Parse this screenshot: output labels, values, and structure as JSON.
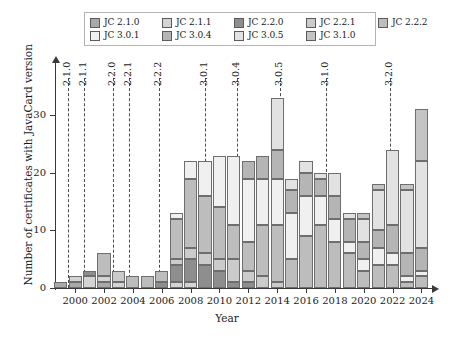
{
  "legend": {
    "rows": [
      [
        {
          "label": "JC 2.1.0",
          "color": "#a9a9a9"
        },
        {
          "label": "JC 2.1.1",
          "color": "#d4d4d4"
        },
        {
          "label": "JC 2.2.0",
          "color": "#8e8e8e"
        },
        {
          "label": "JC 2.2.1",
          "color": "#cbcbcb"
        },
        {
          "label": "JC 2.2.2",
          "color": "#bdbdbd"
        }
      ],
      [
        {
          "label": "JC 3.0.1",
          "color": "#f0f0f0"
        },
        {
          "label": "JC 3.0.4",
          "color": "#b5b5b5"
        },
        {
          "label": "JC 3.0.5",
          "color": "#e2e2e2"
        },
        {
          "label": "JC 3.1.0",
          "color": "#c4c4c4"
        }
      ]
    ]
  },
  "axes": {
    "ylabel": "Number of certificates with JavaCard version",
    "xlabel": "Year",
    "yticks": [
      0,
      10,
      20,
      30
    ],
    "xticks": [
      2000,
      2002,
      2004,
      2006,
      2008,
      2010,
      2012,
      2014,
      2016,
      2018,
      2020,
      2022,
      2024
    ]
  },
  "version_markers": [
    {
      "label": "2.1.0",
      "year": 1999.5
    },
    {
      "label": "2.1.1",
      "year": 2000.6
    },
    {
      "label": "2.2.0",
      "year": 2002.6
    },
    {
      "label": "2.2.1",
      "year": 2003.7
    },
    {
      "label": "2.2.2",
      "year": 2005.8
    },
    {
      "label": "3.0.1",
      "year": 2009.0
    },
    {
      "label": "3.0.4",
      "year": 2011.2
    },
    {
      "label": "3.0.5",
      "year": 2014.2
    },
    {
      "label": "3.1.0",
      "year": 2017.4
    },
    {
      "label": "3.2.0",
      "year": 2021.8
    }
  ],
  "chart_data": {
    "type": "bar",
    "stacked": true,
    "title": "",
    "xlabel": "Year",
    "ylabel": "Number of certificates with JavaCard version",
    "ylim": [
      0,
      34
    ],
    "xlim": [
      1998.6,
      2024.8
    ],
    "grid": false,
    "legend_position": "top",
    "categories": [
      1999,
      2000,
      2001,
      2002,
      2003,
      2004,
      2005,
      2006,
      2007,
      2008,
      2009,
      2010,
      2011,
      2012,
      2013,
      2014,
      2015,
      2016,
      2017,
      2018,
      2019,
      2020,
      2021,
      2022,
      2023,
      2024
    ],
    "series": [
      {
        "name": "JC 2.1.0",
        "color": "#a9a9a9",
        "values": [
          1,
          1,
          0,
          1,
          0,
          0,
          0,
          0,
          0,
          0,
          0,
          0,
          0,
          0,
          0,
          0,
          0,
          0,
          0,
          0,
          0,
          0,
          0,
          0,
          0,
          0
        ]
      },
      {
        "name": "JC 2.1.1",
        "color": "#d4d4d4",
        "values": [
          0,
          1,
          2,
          1,
          1,
          0,
          0,
          0,
          1,
          1,
          0,
          0,
          0,
          0,
          0,
          0,
          0,
          0,
          0,
          0,
          0,
          0,
          0,
          0,
          0,
          0
        ]
      },
      {
        "name": "JC 2.2.0",
        "color": "#8e8e8e",
        "values": [
          0,
          0,
          1,
          0,
          0,
          0,
          0,
          1,
          3,
          4,
          4,
          3,
          1,
          1,
          0,
          0,
          0,
          0,
          0,
          0,
          0,
          0,
          0,
          0,
          0,
          0
        ]
      },
      {
        "name": "JC 2.2.1",
        "color": "#cbcbcb",
        "values": [
          0,
          0,
          0,
          0,
          2,
          0,
          0,
          0,
          1,
          2,
          2,
          2,
          4,
          2,
          2,
          1,
          0,
          0,
          0,
          0,
          0,
          0,
          0,
          0,
          0,
          0
        ]
      },
      {
        "name": "JC 2.2.2",
        "color": "#bdbdbd",
        "values": [
          0,
          0,
          0,
          4,
          0,
          2,
          2,
          2,
          7,
          12,
          10,
          9,
          6,
          5,
          9,
          10,
          5,
          9,
          11,
          8,
          6,
          3,
          4,
          4,
          1,
          2
        ]
      },
      {
        "name": "JC 3.0.1",
        "color": "#f0f0f0",
        "values": [
          0,
          0,
          0,
          0,
          0,
          0,
          0,
          0,
          1,
          3,
          6,
          9,
          12,
          11,
          8,
          8,
          8,
          7,
          5,
          4,
          2,
          2,
          3,
          2,
          1,
          1
        ]
      },
      {
        "name": "JC 3.0.4",
        "color": "#b5b5b5",
        "values": [
          0,
          0,
          0,
          0,
          0,
          0,
          0,
          0,
          0,
          0,
          0,
          0,
          0,
          3,
          4,
          5,
          4,
          4,
          3,
          4,
          4,
          3,
          3,
          5,
          4,
          4
        ]
      },
      {
        "name": "JC 3.0.5",
        "color": "#e2e2e2",
        "values": [
          0,
          0,
          0,
          0,
          0,
          0,
          0,
          0,
          0,
          0,
          0,
          0,
          0,
          0,
          0,
          9,
          2,
          2,
          1,
          4,
          1,
          4,
          7,
          13,
          11,
          15
        ]
      },
      {
        "name": "JC 3.1.0",
        "color": "#c4c4c4",
        "values": [
          0,
          0,
          0,
          0,
          0,
          0,
          0,
          0,
          0,
          0,
          0,
          0,
          0,
          0,
          0,
          0,
          0,
          0,
          0,
          0,
          0,
          1,
          1,
          0,
          1,
          9
        ]
      }
    ]
  }
}
